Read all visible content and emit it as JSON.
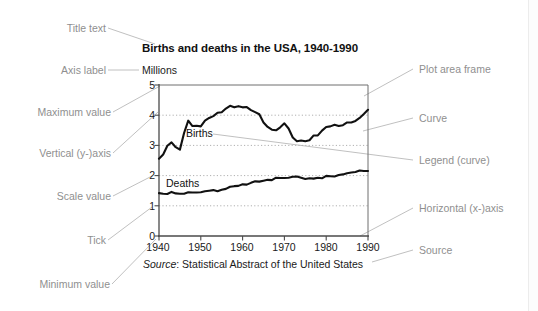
{
  "diagram": {
    "kind": "annotated-chart-anatomy",
    "background": "#ffffff",
    "annotation_color": "#8f8f8f",
    "ink_color": "#111111",
    "gridline_color": "#b3b3b3",
    "annotations_left": [
      {
        "id": "title-text",
        "label": "Title text"
      },
      {
        "id": "axis-label",
        "label": "Axis label"
      },
      {
        "id": "maximum-value",
        "label": "Maximum value"
      },
      {
        "id": "vertical-y-axis",
        "label": "Vertical (y-)axis"
      },
      {
        "id": "scale-value",
        "label": "Scale value"
      },
      {
        "id": "tick",
        "label": "Tick"
      },
      {
        "id": "minimum-value",
        "label": "Minimum value"
      }
    ],
    "annotations_right": [
      {
        "id": "plot-area-frame",
        "label": "Plot area frame"
      },
      {
        "id": "curve",
        "label": "Curve"
      },
      {
        "id": "legend-curve",
        "label": "Legend (curve)"
      },
      {
        "id": "horizontal-x-axis",
        "label": "Horizontal (x-)axis"
      },
      {
        "id": "source",
        "label": "Source"
      }
    ]
  },
  "chart_data": {
    "type": "line",
    "title": "Births and deaths in the USA, 1940-1990",
    "ylabel": "Millions",
    "xlabel": "",
    "source_prefix": "Source",
    "source_text": ": Statistical Abstract of the United States",
    "source_full": "Source: Statistical Abstract of the United States",
    "grid": true,
    "grid_style": "dotted-horizontal",
    "legend_position": "inline-on-curve",
    "xlim": [
      1940,
      1990
    ],
    "ylim": [
      0,
      5
    ],
    "yticks": [
      0,
      1,
      2,
      3,
      4,
      5
    ],
    "ytick_labels": [
      "0",
      "1",
      "2",
      "3",
      "4",
      "5"
    ],
    "xticks": [
      1940,
      1950,
      1960,
      1970,
      1980,
      1990
    ],
    "xtick_labels": [
      "1940",
      "1950",
      "1960",
      "1970",
      "1980",
      "1990"
    ],
    "x": [
      1940,
      1941,
      1942,
      1943,
      1944,
      1945,
      1946,
      1947,
      1948,
      1949,
      1950,
      1951,
      1952,
      1953,
      1954,
      1955,
      1956,
      1957,
      1958,
      1959,
      1960,
      1961,
      1962,
      1963,
      1964,
      1965,
      1966,
      1967,
      1968,
      1969,
      1970,
      1971,
      1972,
      1973,
      1974,
      1975,
      1976,
      1977,
      1978,
      1979,
      1980,
      1981,
      1982,
      1983,
      1984,
      1985,
      1986,
      1987,
      1988,
      1989,
      1990
    ],
    "series": [
      {
        "name": "Births",
        "label": "Births",
        "color": "#111111",
        "values": [
          2.56,
          2.7,
          2.99,
          3.1,
          2.94,
          2.86,
          3.41,
          3.82,
          3.64,
          3.65,
          3.63,
          3.82,
          3.91,
          3.97,
          4.08,
          4.1,
          4.22,
          4.31,
          4.26,
          4.3,
          4.26,
          4.27,
          4.17,
          4.1,
          4.03,
          3.76,
          3.61,
          3.52,
          3.5,
          3.6,
          3.73,
          3.56,
          3.26,
          3.14,
          3.16,
          3.14,
          3.17,
          3.33,
          3.33,
          3.49,
          3.61,
          3.63,
          3.68,
          3.64,
          3.67,
          3.76,
          3.76,
          3.81,
          3.91,
          4.04,
          4.18
        ]
      },
      {
        "name": "Deaths",
        "label": "Deaths",
        "color": "#111111",
        "values": [
          1.42,
          1.4,
          1.39,
          1.46,
          1.41,
          1.4,
          1.4,
          1.45,
          1.44,
          1.44,
          1.45,
          1.48,
          1.5,
          1.52,
          1.48,
          1.53,
          1.56,
          1.63,
          1.65,
          1.66,
          1.71,
          1.7,
          1.76,
          1.81,
          1.8,
          1.83,
          1.86,
          1.85,
          1.93,
          1.92,
          1.92,
          1.93,
          1.96,
          1.97,
          1.93,
          1.89,
          1.91,
          1.9,
          1.93,
          1.91,
          1.99,
          1.98,
          1.97,
          2.02,
          2.04,
          2.08,
          2.1,
          2.12,
          2.17,
          2.15,
          2.15
        ]
      }
    ]
  }
}
